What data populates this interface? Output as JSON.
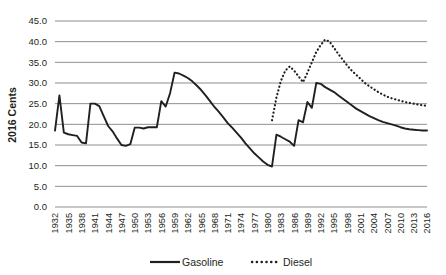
{
  "chart_data": {
    "type": "line",
    "title": "",
    "xlabel": "",
    "ylabel": "2016 Cents",
    "ylim": [
      0,
      45
    ],
    "ytick_step": 5,
    "ytick_labels": [
      "0.0",
      "5.0",
      "10.0",
      "15.0",
      "20.0",
      "25.0",
      "30.0",
      "35.0",
      "40.0",
      "45.0"
    ],
    "xlim": [
      1932,
      2016
    ],
    "xtick_step": 3,
    "xtick_labels": [
      "1932",
      "1935",
      "1938",
      "1941",
      "1944",
      "1947",
      "1950",
      "1953",
      "1956",
      "1959",
      "1962",
      "1965",
      "1968",
      "1971",
      "1974",
      "1977",
      "1980",
      "1983",
      "1986",
      "1989",
      "1992",
      "1995",
      "1998",
      "2001",
      "2004",
      "2007",
      "2010",
      "2013",
      "2016"
    ],
    "grid": "horizontal",
    "legend_position": "bottom",
    "x": [
      1932,
      1933,
      1934,
      1935,
      1936,
      1937,
      1938,
      1939,
      1940,
      1941,
      1942,
      1943,
      1944,
      1945,
      1946,
      1947,
      1948,
      1949,
      1950,
      1951,
      1952,
      1953,
      1954,
      1955,
      1956,
      1957,
      1958,
      1959,
      1960,
      1961,
      1962,
      1963,
      1964,
      1965,
      1966,
      1967,
      1968,
      1969,
      1970,
      1971,
      1972,
      1973,
      1974,
      1975,
      1976,
      1977,
      1978,
      1979,
      1980,
      1981,
      1982,
      1983,
      1984,
      1985,
      1986,
      1987,
      1988,
      1989,
      1990,
      1991,
      1992,
      1993,
      1994,
      1995,
      1996,
      1997,
      1998,
      1999,
      2000,
      2001,
      2002,
      2003,
      2004,
      2005,
      2006,
      2007,
      2008,
      2009,
      2010,
      2011,
      2012,
      2013,
      2014,
      2015,
      2016
    ],
    "series": [
      {
        "name": "Gasoline",
        "style": "solid",
        "color": "#231f20",
        "values": [
          18.5,
          27.0,
          18.0,
          17.6,
          17.4,
          17.2,
          15.6,
          15.4,
          25.0,
          25.0,
          24.4,
          22.0,
          19.6,
          18.3,
          16.6,
          15.0,
          14.8,
          15.2,
          19.2,
          19.2,
          19.0,
          19.3,
          19.3,
          19.3,
          25.6,
          24.3,
          27.6,
          32.5,
          32.3,
          31.8,
          31.2,
          30.4,
          29.4,
          28.3,
          27.0,
          25.6,
          24.2,
          23.0,
          21.7,
          20.3,
          19.2,
          18.0,
          16.8,
          15.4,
          14.2,
          13.0,
          12.0,
          11.0,
          10.2,
          9.8,
          17.5,
          17.0,
          16.4,
          15.8,
          14.8,
          21.0,
          20.5,
          25.4,
          24.0,
          30.0,
          29.8,
          29.0,
          28.4,
          27.8,
          27.0,
          26.2,
          25.4,
          24.6,
          23.8,
          23.2,
          22.6,
          22.0,
          21.5,
          21.0,
          20.6,
          20.3,
          20.0,
          19.7,
          19.3,
          19.0,
          18.8,
          18.7,
          18.6,
          18.5,
          18.5
        ]
      },
      {
        "name": "Diesel",
        "style": "dotted",
        "color": "#231f20",
        "start_year": 1981,
        "values": [
          null,
          null,
          null,
          null,
          null,
          null,
          null,
          null,
          null,
          null,
          null,
          null,
          null,
          null,
          null,
          null,
          null,
          null,
          null,
          null,
          null,
          null,
          null,
          null,
          null,
          null,
          null,
          null,
          null,
          null,
          null,
          null,
          null,
          null,
          null,
          null,
          null,
          null,
          null,
          null,
          null,
          null,
          null,
          null,
          null,
          null,
          null,
          null,
          null,
          21.0,
          26.5,
          30.5,
          33.0,
          34.0,
          33.0,
          31.6,
          30.2,
          32.5,
          35.0,
          37.5,
          39.2,
          40.5,
          40.0,
          38.5,
          37.0,
          35.6,
          34.2,
          33.0,
          32.0,
          31.0,
          30.0,
          29.2,
          28.5,
          27.8,
          27.2,
          26.7,
          26.3,
          26.0,
          25.7,
          25.4,
          25.2,
          25.0,
          24.8,
          24.6,
          24.5
        ]
      }
    ]
  },
  "legend": {
    "items": [
      {
        "label": "Gasoline",
        "style": "solid"
      },
      {
        "label": "Diesel",
        "style": "dotted"
      }
    ]
  },
  "axis": {
    "y_title": "2016 Cents"
  }
}
